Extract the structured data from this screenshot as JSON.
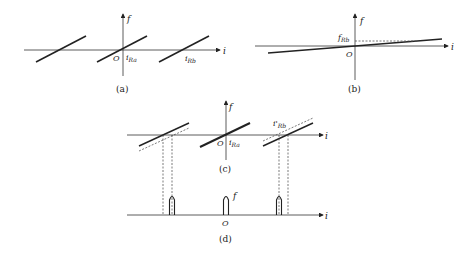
{
  "figure": {
    "panels": [
      {
        "id": "a",
        "caption": "(a)",
        "labels": {
          "y_axis": "f",
          "x_axis": "i",
          "origin": "O",
          "marker1": "i",
          "marker1_sub": "Ra",
          "marker2": "i",
          "marker2_sub": "Rb"
        }
      },
      {
        "id": "b",
        "caption": "(b)",
        "labels": {
          "y_axis": "f",
          "x_axis": "i",
          "origin": "O",
          "level": "f",
          "level_sub": "Rb"
        }
      },
      {
        "id": "c",
        "caption": "(c)",
        "labels": {
          "y_axis": "f",
          "x_axis": "i",
          "origin": "O",
          "marker1": "i",
          "marker1_sub": "Ra",
          "marker2": "i'",
          "marker2_sub": "Rb"
        }
      },
      {
        "id": "d",
        "caption": "(d)",
        "labels": {
          "y_axis": "f",
          "x_axis": "i",
          "origin": "O"
        }
      }
    ],
    "colors": {
      "line": "#222222",
      "dashed": "#444444"
    }
  }
}
